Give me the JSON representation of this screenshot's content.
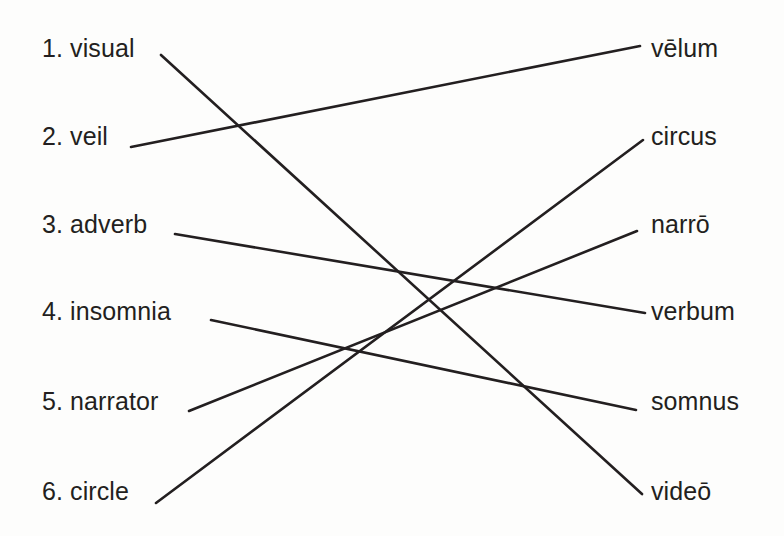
{
  "exercise": {
    "type": "matching-exercise",
    "subject": "English to Latin word derivation matching",
    "line_color": "#231f20",
    "text_color": "#231f20",
    "background_color": "#fdfdfc"
  },
  "left_column": {
    "items": [
      {
        "number": "1.",
        "label": "1. visual",
        "word": "visual",
        "line_start": {
          "x": 161,
          "y": 55
        }
      },
      {
        "number": "2.",
        "label": "2. veil",
        "word": "veil",
        "line_start": {
          "x": 131,
          "y": 147
        }
      },
      {
        "number": "3.",
        "label": "3. adverb",
        "word": "adverb",
        "line_start": {
          "x": 175,
          "y": 234
        }
      },
      {
        "number": "4.",
        "label": "4. insomnia",
        "word": "insomnia",
        "line_start": {
          "x": 211,
          "y": 320
        }
      },
      {
        "number": "5.",
        "label": "5. narrator",
        "word": "narrator",
        "line_start": {
          "x": 189,
          "y": 411
        }
      },
      {
        "number": "6.",
        "label": "6. circle",
        "word": "circle",
        "line_start": {
          "x": 156,
          "y": 503
        }
      }
    ]
  },
  "right_column": {
    "items": [
      {
        "label": "vēlum",
        "line_end": {
          "x": 640,
          "y": 46
        }
      },
      {
        "label": "circus",
        "line_end": {
          "x": 643,
          "y": 140
        }
      },
      {
        "label": "narrō",
        "line_end": {
          "x": 637,
          "y": 231
        }
      },
      {
        "label": "verbum",
        "line_end": {
          "x": 645,
          "y": 313
        }
      },
      {
        "label": "somnus",
        "line_end": {
          "x": 636,
          "y": 410
        }
      },
      {
        "label": "videō",
        "line_end": {
          "x": 642,
          "y": 494
        }
      }
    ]
  },
  "connections": [
    {
      "from": "visual",
      "to": "videō",
      "x1": 161,
      "y1": 55,
      "x2": 642,
      "y2": 494
    },
    {
      "from": "veil",
      "to": "vēlum",
      "x1": 131,
      "y1": 147,
      "x2": 640,
      "y2": 46
    },
    {
      "from": "adverb",
      "to": "verbum",
      "x1": 175,
      "y1": 234,
      "x2": 645,
      "y2": 313
    },
    {
      "from": "insomnia",
      "to": "somnus",
      "x1": 211,
      "y1": 320,
      "x2": 636,
      "y2": 410
    },
    {
      "from": "narrator",
      "to": "narrō",
      "x1": 189,
      "y1": 411,
      "x2": 637,
      "y2": 231
    },
    {
      "from": "circle",
      "to": "circus",
      "x1": 156,
      "y1": 503,
      "x2": 643,
      "y2": 140
    }
  ]
}
